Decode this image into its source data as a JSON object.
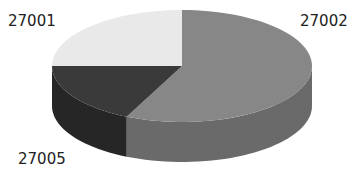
{
  "chart_data": {
    "type": "pie",
    "style": "3d",
    "title": "",
    "categories": [
      "27002",
      "27005",
      "27001"
    ],
    "values": [
      57,
      18,
      25
    ],
    "colors": [
      "#878787",
      "#3a3a3a",
      "#e9e9e9"
    ],
    "side_colors": [
      "#6a6a6a",
      "#262626",
      "#c8c8c8"
    ],
    "start_angle_deg": 0,
    "direction": "clockwise",
    "legend": "none",
    "labels": [
      {
        "text": "27001",
        "x": 8,
        "y": 14
      },
      {
        "text": "27002",
        "x": 300,
        "y": 14
      },
      {
        "text": "27005",
        "x": 18,
        "y": 152
      }
    ]
  },
  "geometry": {
    "cx": 182,
    "cy": 66,
    "rx": 130,
    "ry": 56,
    "depth": 40
  }
}
